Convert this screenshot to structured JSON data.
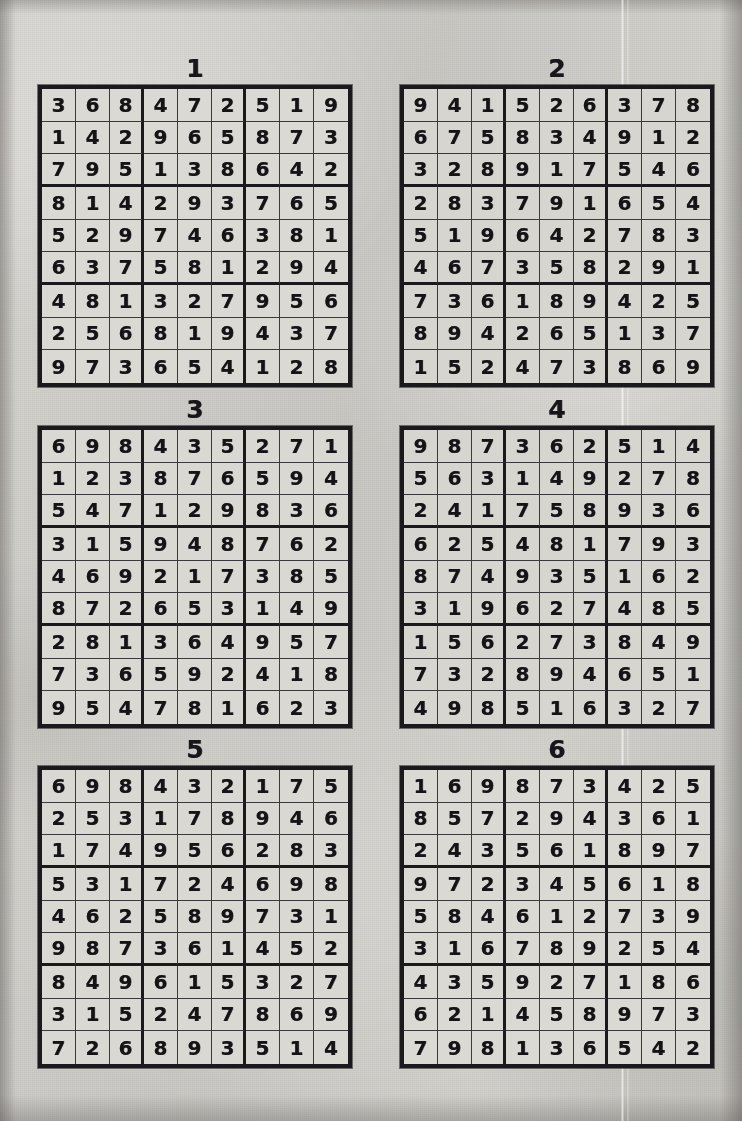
{
  "page": {
    "kind": "sudoku-solutions-sheet",
    "background_color": "#cdcbc6",
    "ink_color": "#141416",
    "cell_color": "#d9d7d2",
    "puzzle_count": 6,
    "columns": 2,
    "rows": 3
  },
  "puzzles": [
    {
      "title": "1",
      "grid": [
        [
          "3",
          "6",
          "8",
          "4",
          "7",
          "2",
          "5",
          "1",
          "9"
        ],
        [
          "1",
          "4",
          "2",
          "9",
          "6",
          "5",
          "8",
          "7",
          "3"
        ],
        [
          "7",
          "9",
          "5",
          "1",
          "3",
          "8",
          "6",
          "4",
          "2"
        ],
        [
          "8",
          "1",
          "4",
          "2",
          "9",
          "3",
          "7",
          "6",
          "5"
        ],
        [
          "5",
          "2",
          "9",
          "7",
          "4",
          "6",
          "3",
          "8",
          "1"
        ],
        [
          "6",
          "3",
          "7",
          "5",
          "8",
          "1",
          "2",
          "9",
          "4"
        ],
        [
          "4",
          "8",
          "1",
          "3",
          "2",
          "7",
          "9",
          "5",
          "6"
        ],
        [
          "2",
          "5",
          "6",
          "8",
          "1",
          "9",
          "4",
          "3",
          "7"
        ],
        [
          "9",
          "7",
          "3",
          "6",
          "5",
          "4",
          "1",
          "2",
          "8"
        ]
      ]
    },
    {
      "title": "2",
      "grid": [
        [
          "9",
          "4",
          "1",
          "5",
          "2",
          "6",
          "3",
          "7",
          "8"
        ],
        [
          "6",
          "7",
          "5",
          "8",
          "3",
          "4",
          "9",
          "1",
          "2"
        ],
        [
          "3",
          "2",
          "8",
          "9",
          "1",
          "7",
          "5",
          "4",
          "6"
        ],
        [
          "2",
          "8",
          "3",
          "7",
          "9",
          "1",
          "6",
          "5",
          "4"
        ],
        [
          "5",
          "1",
          "9",
          "6",
          "4",
          "2",
          "7",
          "8",
          "3"
        ],
        [
          "4",
          "6",
          "7",
          "3",
          "5",
          "8",
          "2",
          "9",
          "1"
        ],
        [
          "7",
          "3",
          "6",
          "1",
          "8",
          "9",
          "4",
          "2",
          "5"
        ],
        [
          "8",
          "9",
          "4",
          "2",
          "6",
          "5",
          "1",
          "3",
          "7"
        ],
        [
          "1",
          "5",
          "2",
          "4",
          "7",
          "3",
          "8",
          "6",
          "9"
        ]
      ]
    },
    {
      "title": "3",
      "grid": [
        [
          "6",
          "9",
          "8",
          "4",
          "3",
          "5",
          "2",
          "7",
          "1"
        ],
        [
          "1",
          "2",
          "3",
          "8",
          "7",
          "6",
          "5",
          "9",
          "4"
        ],
        [
          "5",
          "4",
          "7",
          "1",
          "2",
          "9",
          "8",
          "3",
          "6"
        ],
        [
          "3",
          "1",
          "5",
          "9",
          "4",
          "8",
          "7",
          "6",
          "2"
        ],
        [
          "4",
          "6",
          "9",
          "2",
          "1",
          "7",
          "3",
          "8",
          "5"
        ],
        [
          "8",
          "7",
          "2",
          "6",
          "5",
          "3",
          "1",
          "4",
          "9"
        ],
        [
          "2",
          "8",
          "1",
          "3",
          "6",
          "4",
          "9",
          "5",
          "7"
        ],
        [
          "7",
          "3",
          "6",
          "5",
          "9",
          "2",
          "4",
          "1",
          "8"
        ],
        [
          "9",
          "5",
          "4",
          "7",
          "8",
          "1",
          "6",
          "2",
          "3"
        ]
      ]
    },
    {
      "title": "4",
      "grid": [
        [
          "9",
          "8",
          "7",
          "3",
          "6",
          "2",
          "5",
          "1",
          "4"
        ],
        [
          "5",
          "6",
          "3",
          "1",
          "4",
          "9",
          "2",
          "7",
          "8"
        ],
        [
          "2",
          "4",
          "1",
          "7",
          "5",
          "8",
          "9",
          "3",
          "6"
        ],
        [
          "6",
          "2",
          "5",
          "4",
          "8",
          "1",
          "7",
          "9",
          "3"
        ],
        [
          "8",
          "7",
          "4",
          "9",
          "3",
          "5",
          "1",
          "6",
          "2"
        ],
        [
          "3",
          "1",
          "9",
          "6",
          "2",
          "7",
          "4",
          "8",
          "5"
        ],
        [
          "1",
          "5",
          "6",
          "2",
          "7",
          "3",
          "8",
          "4",
          "9"
        ],
        [
          "7",
          "3",
          "2",
          "8",
          "9",
          "4",
          "6",
          "5",
          "1"
        ],
        [
          "4",
          "9",
          "8",
          "5",
          "1",
          "6",
          "3",
          "2",
          "7"
        ]
      ]
    },
    {
      "title": "5",
      "grid": [
        [
          "6",
          "9",
          "8",
          "4",
          "3",
          "2",
          "1",
          "7",
          "5"
        ],
        [
          "2",
          "5",
          "3",
          "1",
          "7",
          "8",
          "9",
          "4",
          "6"
        ],
        [
          "1",
          "7",
          "4",
          "9",
          "5",
          "6",
          "2",
          "8",
          "3"
        ],
        [
          "5",
          "3",
          "1",
          "7",
          "2",
          "4",
          "6",
          "9",
          "8"
        ],
        [
          "4",
          "6",
          "2",
          "5",
          "8",
          "9",
          "7",
          "3",
          "1"
        ],
        [
          "9",
          "8",
          "7",
          "3",
          "6",
          "1",
          "4",
          "5",
          "2"
        ],
        [
          "8",
          "4",
          "9",
          "6",
          "1",
          "5",
          "3",
          "2",
          "7"
        ],
        [
          "3",
          "1",
          "5",
          "2",
          "4",
          "7",
          "8",
          "6",
          "9"
        ],
        [
          "7",
          "2",
          "6",
          "8",
          "9",
          "3",
          "5",
          "1",
          "4"
        ]
      ]
    },
    {
      "title": "6",
      "grid": [
        [
          "1",
          "6",
          "9",
          "8",
          "7",
          "3",
          "4",
          "2",
          "5"
        ],
        [
          "8",
          "5",
          "7",
          "2",
          "9",
          "4",
          "3",
          "6",
          "1"
        ],
        [
          "2",
          "4",
          "3",
          "5",
          "6",
          "1",
          "8",
          "9",
          "7"
        ],
        [
          "9",
          "7",
          "2",
          "3",
          "4",
          "5",
          "6",
          "1",
          "8"
        ],
        [
          "5",
          "8",
          "4",
          "6",
          "1",
          "2",
          "7",
          "3",
          "9"
        ],
        [
          "3",
          "1",
          "6",
          "7",
          "8",
          "9",
          "2",
          "5",
          "4"
        ],
        [
          "4",
          "3",
          "5",
          "9",
          "2",
          "7",
          "1",
          "8",
          "6"
        ],
        [
          "6",
          "2",
          "1",
          "4",
          "5",
          "8",
          "9",
          "7",
          "3"
        ],
        [
          "7",
          "9",
          "8",
          "1",
          "3",
          "6",
          "5",
          "4",
          "2"
        ]
      ]
    }
  ]
}
